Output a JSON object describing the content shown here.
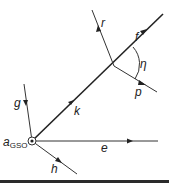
{
  "diagram": {
    "origin_label": "a",
    "origin_subscript": "GSO",
    "vectors": [
      {
        "name": "k",
        "label": "k"
      },
      {
        "name": "f",
        "label": "f"
      },
      {
        "name": "r",
        "label": "r"
      },
      {
        "name": "p",
        "label": "p"
      },
      {
        "name": "e",
        "label": "e"
      },
      {
        "name": "g",
        "label": "g"
      },
      {
        "name": "h",
        "label": "h"
      }
    ],
    "angle_label": "η"
  },
  "colors": {
    "line": "#333333",
    "bottom_bar": "#2a2a2a",
    "background": "#ffffff"
  }
}
